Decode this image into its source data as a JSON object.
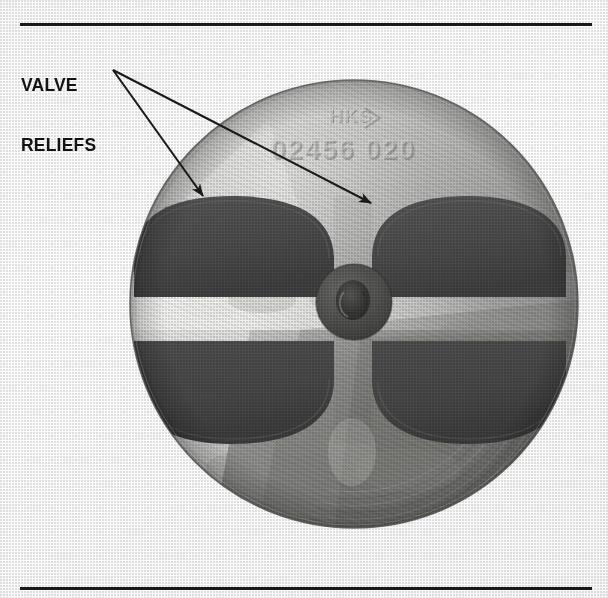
{
  "figure": {
    "kind": "halftone-photograph",
    "background_color": "#fdfdfd",
    "rules": {
      "color": "#1a1a1a",
      "top": {
        "y": 24,
        "x_start": 20,
        "x_end": 592,
        "thickness": 3
      },
      "bottom": {
        "y": 588,
        "x_start": 20,
        "x_end": 592,
        "thickness": 3
      }
    }
  },
  "callout": {
    "label_line_1": "VALVE",
    "label_line_2": "RELIEFS",
    "text_color": "#141414",
    "leader_color": "#1c1c1c",
    "origin": {
      "x": 113,
      "y": 70
    },
    "arrows": [
      {
        "name": "left-valve-relief",
        "tip_x": 208,
        "tip_y": 200
      },
      {
        "name": "right-valve-relief",
        "tip_x": 377,
        "tip_y": 207
      }
    ]
  },
  "piston": {
    "center": {
      "x": 354,
      "y": 304
    },
    "radius": 224,
    "rim_color": "#6f6f6f",
    "face_light": "#e9e9e7",
    "face_mid": "#a8a8a6",
    "face_dark": "#7b7b79",
    "pocket_color": "#4a4a4a",
    "center_boss": {
      "name": "center-boss",
      "cx": 354,
      "cy": 302,
      "r": 38,
      "color": "#4f4f4f",
      "dimple_r": 17,
      "dimple_color": "#3b3b3b"
    },
    "valve_reliefs": [
      {
        "name": "valve-relief-top-left",
        "cx": 232,
        "cy": 248,
        "rx": 102,
        "ry": 50,
        "orientation": "flat-bottom"
      },
      {
        "name": "valve-relief-top-right",
        "cx": 466,
        "cy": 248,
        "rx": 100,
        "ry": 50,
        "orientation": "flat-bottom"
      },
      {
        "name": "valve-relief-bottom-left",
        "cx": 232,
        "cy": 370,
        "rx": 102,
        "ry": 50,
        "orientation": "flat-top"
      },
      {
        "name": "valve-relief-bottom-right",
        "cx": 466,
        "cy": 370,
        "rx": 100,
        "ry": 50,
        "orientation": "flat-top"
      }
    ]
  },
  "stamped_markings": {
    "logo_text": "HKS",
    "part_number": "02456 020",
    "engraved_color": "#d6d6d2",
    "shadow_color": "#6b6b69"
  }
}
